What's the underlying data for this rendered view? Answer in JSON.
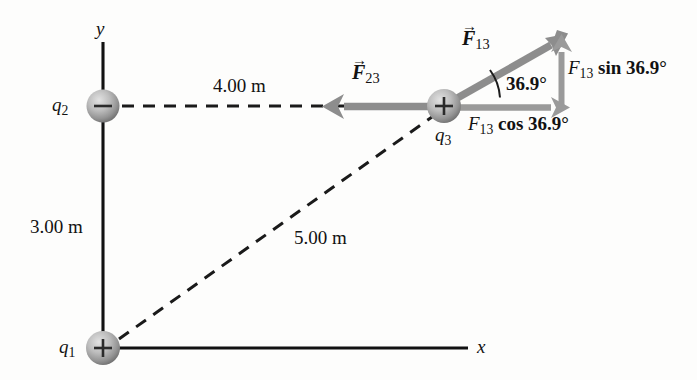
{
  "figure": {
    "type": "physics-free-body-diagram",
    "colors": {
      "background": "#fdfdfc",
      "axis": "#111111",
      "dashed": "#1a1a1a",
      "force_arrow": "#8d8d8d",
      "component_arrow": "#9a9a9a",
      "sphere_light": "#d8d8d8",
      "sphere_dark": "#7a7a7a",
      "text": "#121212"
    }
  },
  "axes": {
    "x_label": "x",
    "y_label": "y"
  },
  "charges": [
    {
      "id": "q1",
      "label": "q",
      "subscript": "1",
      "sign": "+",
      "x": 103,
      "y": 348
    },
    {
      "id": "q2",
      "label": "q",
      "subscript": "2",
      "sign": "−",
      "x": 103,
      "y": 106
    },
    {
      "id": "q3",
      "label": "q",
      "subscript": "3",
      "sign": "+",
      "x": 444,
      "y": 106
    }
  ],
  "dimensions": [
    {
      "name": "vertical-distance",
      "value": "3.00 m"
    },
    {
      "name": "horizontal-distance",
      "value": "4.00 m"
    },
    {
      "name": "diagonal-distance",
      "value": "5.00 m"
    }
  ],
  "vectors": [
    {
      "name": "F13",
      "label": "F",
      "subscript": "13",
      "is_vector": true
    },
    {
      "name": "F23",
      "label": "F",
      "subscript": "23",
      "is_vector": true
    }
  ],
  "angle": {
    "value": "36.9°"
  },
  "components": {
    "sin_label_main": "F",
    "sin_label_sub": "13",
    "sin_label_rest": " sin 36.9°",
    "cos_label_main": "F",
    "cos_label_sub": "13",
    "cos_label_rest": " cos 36.9°"
  }
}
